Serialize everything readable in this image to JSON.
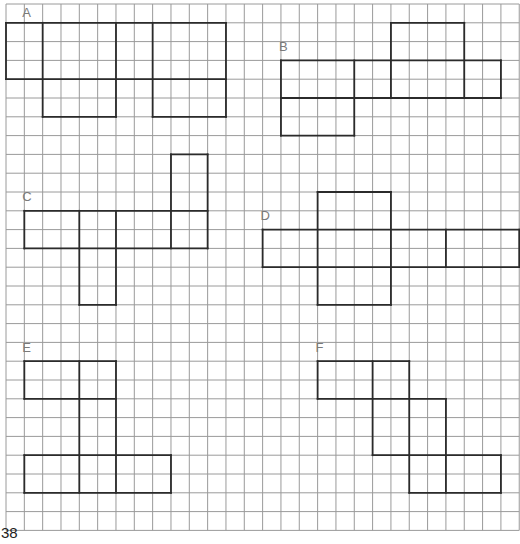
{
  "page": {
    "number": "38"
  },
  "grid": {
    "origin_x": 6,
    "origin_y": 4,
    "cell_w": 18.33,
    "cell_h": 18.8,
    "cols": 28,
    "rows": 28,
    "line_color": "#9a9a9a"
  },
  "nets": [
    {
      "label": "A",
      "label_pos": [
        1,
        0.8
      ],
      "segments": [
        [
          0,
          1,
          12,
          1
        ],
        [
          0,
          4,
          12,
          4
        ],
        [
          0,
          1,
          0,
          4
        ],
        [
          2,
          1,
          2,
          6
        ],
        [
          6,
          1,
          6,
          6
        ],
        [
          8,
          1,
          8,
          6
        ],
        [
          12,
          1,
          12,
          6
        ],
        [
          2,
          6,
          6,
          6
        ],
        [
          8,
          6,
          12,
          6
        ]
      ]
    },
    {
      "label": "B",
      "label_pos": [
        15,
        2.6
      ],
      "segments": [
        [
          15,
          3,
          27,
          3
        ],
        [
          15,
          5,
          27,
          5
        ],
        [
          15,
          3,
          15,
          7
        ],
        [
          19,
          3,
          19,
          7
        ],
        [
          15,
          7,
          19,
          7
        ],
        [
          21,
          1,
          25,
          1
        ],
        [
          21,
          1,
          21,
          5
        ],
        [
          25,
          1,
          25,
          5
        ],
        [
          27,
          3,
          27,
          5
        ]
      ]
    },
    {
      "label": "C",
      "label_pos": [
        1,
        10.6
      ],
      "segments": [
        [
          1,
          11,
          11,
          11
        ],
        [
          1,
          13,
          11,
          13
        ],
        [
          1,
          11,
          1,
          13
        ],
        [
          4,
          11,
          4,
          16
        ],
        [
          6,
          11,
          6,
          16
        ],
        [
          4,
          16,
          6,
          16
        ],
        [
          9,
          8,
          9,
          13
        ],
        [
          11,
          8,
          11,
          13
        ],
        [
          9,
          8,
          11,
          8
        ]
      ]
    },
    {
      "label": "D",
      "label_pos": [
        14,
        11.6
      ],
      "segments": [
        [
          14,
          12,
          28,
          12
        ],
        [
          14,
          14,
          28,
          14
        ],
        [
          14,
          12,
          14,
          14
        ],
        [
          28,
          12,
          28,
          14
        ],
        [
          24,
          12,
          24,
          14
        ],
        [
          17,
          10,
          21,
          10
        ],
        [
          17,
          10,
          17,
          16
        ],
        [
          21,
          10,
          21,
          16
        ],
        [
          17,
          16,
          21,
          16
        ]
      ]
    },
    {
      "label": "E",
      "label_pos": [
        1,
        18.6
      ],
      "segments": [
        [
          1,
          19,
          6,
          19
        ],
        [
          1,
          21,
          6,
          21
        ],
        [
          1,
          19,
          1,
          21
        ],
        [
          4,
          19,
          4,
          26
        ],
        [
          6,
          19,
          6,
          26
        ],
        [
          1,
          24,
          9,
          24
        ],
        [
          1,
          26,
          9,
          26
        ],
        [
          1,
          24,
          1,
          26
        ],
        [
          9,
          24,
          9,
          26
        ]
      ]
    },
    {
      "label": "F",
      "label_pos": [
        17,
        18.6
      ],
      "segments": [
        [
          17,
          19,
          22,
          19
        ],
        [
          17,
          21,
          24,
          21
        ],
        [
          17,
          19,
          17,
          21
        ],
        [
          20,
          19,
          20,
          24
        ],
        [
          22,
          19,
          22,
          26
        ],
        [
          24,
          21,
          24,
          26
        ],
        [
          20,
          24,
          27,
          24
        ],
        [
          22,
          26,
          27,
          26
        ],
        [
          27,
          24,
          27,
          26
        ]
      ]
    }
  ]
}
